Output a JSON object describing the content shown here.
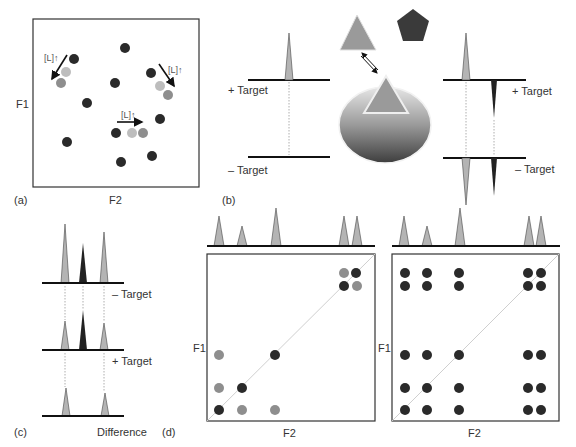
{
  "colors": {
    "dark_dot": "#2a2a2a",
    "mid_dot": "#8e8e8e",
    "light_dot": "#bdbdbd",
    "peak_light": "#b4b4b4",
    "peak_dark": "#222222",
    "line": "#111111",
    "diagonal": "#cfcfcf",
    "box": "#333333"
  },
  "panel_a": {
    "label": "(a)",
    "x_axis": "F2",
    "y_axis": "F1",
    "shift_label": "[L]↑",
    "dots": [
      {
        "x": 125,
        "y": 48,
        "tone": "dark"
      },
      {
        "x": 74,
        "y": 59,
        "tone": "dark"
      },
      {
        "x": 66,
        "y": 72,
        "tone": "light"
      },
      {
        "x": 61,
        "y": 83,
        "tone": "mid"
      },
      {
        "x": 115,
        "y": 83,
        "tone": "dark"
      },
      {
        "x": 87,
        "y": 103,
        "tone": "dark"
      },
      {
        "x": 151,
        "y": 73,
        "tone": "dark"
      },
      {
        "x": 160,
        "y": 86,
        "tone": "light"
      },
      {
        "x": 168,
        "y": 95,
        "tone": "mid"
      },
      {
        "x": 160,
        "y": 119,
        "tone": "dark"
      },
      {
        "x": 116,
        "y": 133,
        "tone": "dark"
      },
      {
        "x": 132,
        "y": 133,
        "tone": "light"
      },
      {
        "x": 143,
        "y": 133,
        "tone": "mid"
      },
      {
        "x": 67,
        "y": 142,
        "tone": "dark"
      },
      {
        "x": 152,
        "y": 156,
        "tone": "dark"
      },
      {
        "x": 121,
        "y": 162,
        "tone": "dark"
      }
    ]
  },
  "panel_b": {
    "label": "(b)",
    "plus_target": "+ Target",
    "minus_target": "– Target"
  },
  "panel_c": {
    "label": "(c)",
    "minus_target": "– Target",
    "plus_target": "+ Target",
    "difference": "Difference"
  },
  "panel_d": {
    "label": "(d)",
    "x_axis": "F2",
    "y_axis": "F1",
    "left_x_axis": "F2",
    "left_y_axis": "F1",
    "right_x_axis": "F2",
    "right_y_axis": "F1"
  }
}
